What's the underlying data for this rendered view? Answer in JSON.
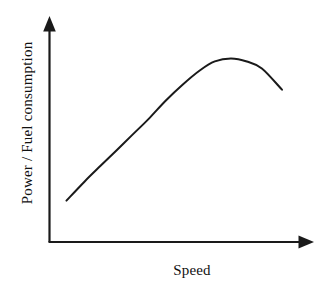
{
  "figure": {
    "background_color": "#ffffff",
    "ink_color": "#1a1a1a"
  },
  "chart_data": {
    "type": "line",
    "title": "",
    "xlabel": "Speed",
    "ylabel": "Power / Fuel consumption",
    "grid": false,
    "legend": null,
    "tick_labels": {
      "x": [],
      "y": []
    },
    "axis_style": {
      "x_axis_arrow": true,
      "y_axis_arrow": true,
      "x_axis_label_text": "Speed",
      "y_axis_label_text": "Power / Fuel consumption"
    },
    "xlim": [
      0,
      1
    ],
    "ylim": [
      0,
      1
    ],
    "series": [
      {
        "name": "Power / Fuel consumption vs Speed",
        "description": "Rises steeply and near-linearly, flattens to a broad maximum, then declines",
        "x": [
          0.064,
          0.133,
          0.193,
          0.254,
          0.314,
          0.375,
          0.439,
          0.503,
          0.568,
          0.625,
          0.686,
          0.746,
          0.803,
          0.879
        ],
        "y": [
          0.183,
          0.268,
          0.337,
          0.406,
          0.475,
          0.545,
          0.625,
          0.696,
          0.759,
          0.799,
          0.812,
          0.799,
          0.768,
          0.674
        ]
      }
    ],
    "annotations": []
  },
  "labels": {
    "y_axis": "Power / Fuel consumption",
    "x_axis": "Speed"
  },
  "icons": {
    "y_axis_arrow": "arrow-up-icon",
    "x_axis_arrow": "arrow-right-icon"
  }
}
